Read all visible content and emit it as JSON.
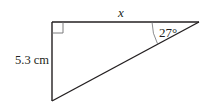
{
  "diagram": {
    "type": "right-triangle",
    "labels": {
      "top_side": "x",
      "left_side": "5.3 cm",
      "angle": "27°"
    },
    "colors": {
      "stroke": "#231f20",
      "right_angle_marker": "#6d6e71",
      "arc": "#6d6e71",
      "background": "#ffffff"
    },
    "vertices": {
      "right_angle": [
        52,
        22
      ],
      "acute_27": [
        199,
        22
      ],
      "bottom": [
        52,
        101
      ]
    }
  }
}
